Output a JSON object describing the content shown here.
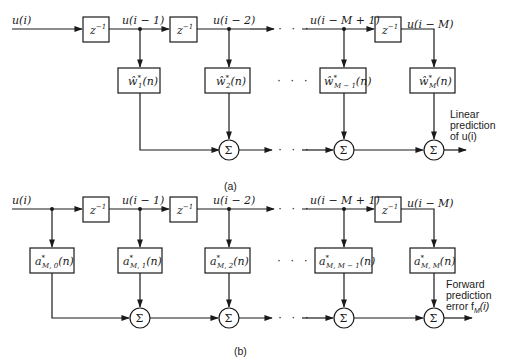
{
  "diagram_a": {
    "caption": "(a)",
    "signals": {
      "input": "u(i)",
      "d1": "u(i − 1)",
      "d2": "u(i − 2)",
      "dM1": "u(i − M + 1)",
      "dM": "u(i − M)"
    },
    "delay_label": "z",
    "delay_exp": "−1",
    "weights": [
      {
        "base": "ŵ",
        "sup": "*",
        "sub": "1",
        "arg": "(n)"
      },
      {
        "base": "ŵ",
        "sup": "*",
        "sub": "2",
        "arg": "(n)"
      },
      {
        "base": "ŵ",
        "sup": "*",
        "sub": "M − 1",
        "arg": "(n)"
      },
      {
        "base": "ŵ",
        "sup": "*",
        "sub": "M",
        "arg": "(n)"
      }
    ],
    "sum_symbol": "Σ",
    "ellipsis": "· · ·",
    "output_label": [
      "Linear",
      "prediction",
      "of u(i)"
    ]
  },
  "diagram_b": {
    "caption": "(b)",
    "signals": {
      "input": "u(i)",
      "d1": "u(i − 1)",
      "d2": "u(i − 2)",
      "dM1": "u(i − M + 1)",
      "dM": "u(i − M)"
    },
    "delay_label": "z",
    "delay_exp": "−1",
    "coefficients": [
      {
        "base": "a",
        "sup": "*",
        "sub": "M, 0",
        "arg": "(n)"
      },
      {
        "base": "a",
        "sup": "*",
        "sub": "M, 1",
        "arg": "(n)"
      },
      {
        "base": "a",
        "sup": "*",
        "sub": "M, 2",
        "arg": "(n)"
      },
      {
        "base": "a",
        "sup": "*",
        "sub": "M, M − 1",
        "arg": "(n)"
      },
      {
        "base": "a",
        "sup": "*",
        "sub": "M, M",
        "arg": "(n)"
      }
    ],
    "sum_symbol": "Σ",
    "ellipsis": "· · ·",
    "output_label": [
      "Forward",
      "prediction",
      "error f",
      "M",
      "(i)"
    ]
  }
}
